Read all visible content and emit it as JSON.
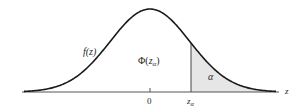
{
  "diagram": {
    "type": "standard normal distribution curve",
    "curve_label": "f(z)",
    "area_label_main": "Φ",
    "area_label_arg": "z",
    "area_label_sub": "α",
    "tail_label": "α",
    "axis_label": "z",
    "ticks": [
      {
        "value": "0"
      },
      {
        "value_main": "z",
        "value_sub": "α"
      }
    ],
    "colors": {
      "curve": "#1a1a1a",
      "axis": "#555555",
      "shaded_tail": "#e6e6e6",
      "background": "#ffffff"
    }
  }
}
